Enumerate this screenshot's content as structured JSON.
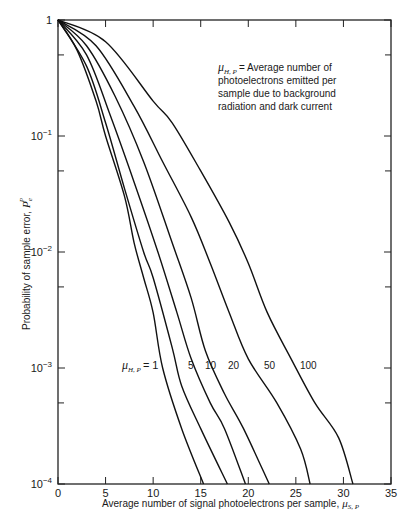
{
  "chart_data": {
    "type": "line",
    "title": "",
    "xlabel": "Average number of signal photoelectrons per sample, μS,P",
    "ylabel": "Probability of sample error, Pe^P",
    "xlim": [
      0,
      35
    ],
    "ylim": [
      0.0001,
      1
    ],
    "yscale": "log",
    "grid": false,
    "x_ticks": [
      "0",
      "5",
      "10",
      "15",
      "20",
      "25",
      "30",
      "35"
    ],
    "y_ticks": [
      "1",
      "10^-1",
      "10^-2",
      "10^-3",
      "10^-4"
    ],
    "annotation": "μH,P = Average number of photoelectrons emitted per sample due to background radiation and dark current",
    "legend_prefix": "μH,P =",
    "series": [
      {
        "name": "1",
        "points": [
          [
            0,
            1
          ],
          [
            2,
            0.55
          ],
          [
            4,
            0.2
          ],
          [
            5,
            0.1
          ],
          [
            7,
            0.03
          ],
          [
            8,
            0.012
          ],
          [
            9,
            0.006
          ],
          [
            10,
            0.003
          ],
          [
            11,
            0.001
          ],
          [
            13,
            0.0003
          ],
          [
            15.3,
            0.0001
          ]
        ]
      },
      {
        "name": "5",
        "points": [
          [
            0,
            1
          ],
          [
            3,
            0.4
          ],
          [
            5,
            0.13
          ],
          [
            7,
            0.035
          ],
          [
            9,
            0.01
          ],
          [
            10,
            0.006
          ],
          [
            12,
            0.0015
          ],
          [
            13,
            0.0007
          ],
          [
            15,
            0.0003
          ],
          [
            17.8,
            0.0001
          ]
        ]
      },
      {
        "name": "10",
        "points": [
          [
            0,
            1
          ],
          [
            3,
            0.5
          ],
          [
            5.5,
            0.15
          ],
          [
            8,
            0.04
          ],
          [
            10.5,
            0.01
          ],
          [
            12.5,
            0.003
          ],
          [
            14,
            0.0012
          ],
          [
            16,
            0.0005
          ],
          [
            17.5,
            0.0003
          ],
          [
            19.7,
            0.0001
          ]
        ]
      },
      {
        "name": "20",
        "points": [
          [
            0,
            1
          ],
          [
            3,
            0.6
          ],
          [
            6,
            0.22
          ],
          [
            9,
            0.06
          ],
          [
            12,
            0.012
          ],
          [
            14,
            0.004
          ],
          [
            15.5,
            0.0014
          ],
          [
            17.5,
            0.0006
          ],
          [
            19.5,
            0.0003
          ],
          [
            22.2,
            0.0001
          ]
        ]
      },
      {
        "name": "50",
        "points": [
          [
            0,
            1
          ],
          [
            4,
            0.6
          ],
          [
            8,
            0.18
          ],
          [
            11,
            0.06
          ],
          [
            14,
            0.02
          ],
          [
            16,
            0.008
          ],
          [
            18,
            0.003
          ],
          [
            20,
            0.0012
          ],
          [
            23,
            0.0005
          ],
          [
            25.5,
            0.0002
          ],
          [
            26.5,
            0.0001
          ]
        ]
      },
      {
        "name": "100",
        "points": [
          [
            0,
            1
          ],
          [
            5,
            0.65
          ],
          [
            10,
            0.2
          ],
          [
            12,
            0.13
          ],
          [
            15,
            0.05
          ],
          [
            18,
            0.018
          ],
          [
            20,
            0.008
          ],
          [
            22,
            0.003
          ],
          [
            24.5,
            0.0012
          ],
          [
            27,
            0.0005
          ],
          [
            29.5,
            0.00025
          ],
          [
            31,
            0.0001
          ]
        ]
      }
    ]
  },
  "labels": {
    "note_line1_rest": "= Average number of",
    "note_line2": "photoelectrons emitted per",
    "note_line3": "sample due to background",
    "note_line4": "radiation and dark current",
    "mu_symbol": "μ",
    "mu_sub_HP": "H, P",
    "mu_sub_SP": "S, P",
    "legend_eq": "= 1",
    "xlabel_text": "Average number of signal photoelectrons per sample,",
    "ylabel_text": "Probability of sample error,",
    "ylabel_sym": "P",
    "ylabel_sub": "e",
    "ylabel_sup": "P",
    "series_labels": [
      "5",
      "10",
      "20",
      "50",
      "100"
    ]
  }
}
